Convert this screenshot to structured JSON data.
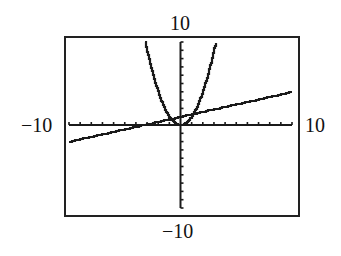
{
  "window": {
    "xmin": "-10",
    "xmax": "10",
    "ymin": "-10",
    "ymax": "10"
  },
  "chart_data": {
    "type": "line",
    "title": "",
    "xlabel": "",
    "ylabel": "",
    "xlim": [
      -10,
      10
    ],
    "ylim": [
      -10,
      10
    ],
    "grid": false,
    "axis_ticks": {
      "x_step": 1,
      "y_step": 1
    },
    "tick_labels": {
      "top": "10",
      "bottom": "-10",
      "left": "-10",
      "right": "10"
    },
    "series": [
      {
        "name": "parabola",
        "formula_estimate": "y = x^2",
        "x": [
          -3.16,
          -3,
          -2.5,
          -2,
          -1.5,
          -1,
          -0.5,
          0,
          0.5,
          1,
          1.5,
          2,
          2.5,
          3,
          3.16
        ],
        "y": [
          10,
          9,
          6.25,
          4,
          2.25,
          1,
          0.25,
          0,
          0.25,
          1,
          2.25,
          4,
          6.25,
          9,
          10
        ]
      },
      {
        "name": "line",
        "formula_estimate": "y = 0.3x + 1",
        "x": [
          -10,
          -5,
          0,
          5,
          10
        ],
        "y": [
          -2,
          -0.5,
          1,
          2.5,
          4
        ]
      }
    ],
    "colors": {
      "curve": "#1a1a1a",
      "axes": "#1a1a1a",
      "frame": "#222222"
    }
  }
}
